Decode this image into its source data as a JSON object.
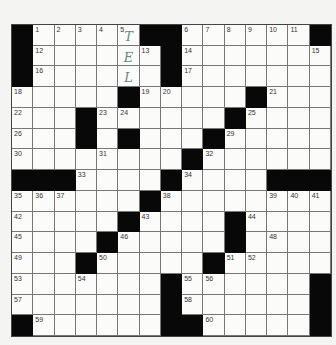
{
  "puzzle": {
    "rows": 15,
    "cols": 15,
    "colors": {
      "black": "#080808",
      "white": "#fbfbfa",
      "pencil": "#6a8a7c"
    },
    "grid": [
      "#.....##......#",
      "#......#.......",
      "#......#.......",
      ".....#.....#...",
      "...#......#....",
      "...#.#...#.....",
      "........#......",
      "###....#....###",
      "......#.....   ",
      ".....#....#....",
      "....#.....#....",
      "...#.....#.....",
      ".......#......#",
      ".......#......#",
      "#......##.....#"
    ],
    "numbers": [
      {
        "r": 0,
        "c": 1,
        "n": 1
      },
      {
        "r": 0,
        "c": 2,
        "n": 2
      },
      {
        "r": 0,
        "c": 3,
        "n": 3
      },
      {
        "r": 0,
        "c": 4,
        "n": 4
      },
      {
        "r": 0,
        "c": 5,
        "n": 5
      },
      {
        "r": 0,
        "c": 8,
        "n": 6
      },
      {
        "r": 0,
        "c": 9,
        "n": 7
      },
      {
        "r": 0,
        "c": 10,
        "n": 8
      },
      {
        "r": 0,
        "c": 11,
        "n": 9
      },
      {
        "r": 0,
        "c": 12,
        "n": 10
      },
      {
        "r": 0,
        "c": 13,
        "n": 11
      },
      {
        "r": 1,
        "c": 1,
        "n": 12
      },
      {
        "r": 1,
        "c": 6,
        "n": 13
      },
      {
        "r": 1,
        "c": 8,
        "n": 14
      },
      {
        "r": 1,
        "c": 14,
        "n": 15
      },
      {
        "r": 2,
        "c": 1,
        "n": 16
      },
      {
        "r": 2,
        "c": 8,
        "n": 17
      },
      {
        "r": 3,
        "c": 0,
        "n": 18
      },
      {
        "r": 3,
        "c": 6,
        "n": 19
      },
      {
        "r": 3,
        "c": 7,
        "n": 20
      },
      {
        "r": 3,
        "c": 12,
        "n": 21
      },
      {
        "r": 4,
        "c": 0,
        "n": 22
      },
      {
        "r": 4,
        "c": 4,
        "n": 23
      },
      {
        "r": 4,
        "c": 5,
        "n": 24
      },
      {
        "r": 4,
        "c": 11,
        "n": 25
      },
      {
        "r": 5,
        "c": 0,
        "n": 26
      },
      {
        "r": 5,
        "c": 3,
        "n": 27
      },
      {
        "r": 5,
        "c": 5,
        "n": 28
      },
      {
        "r": 5,
        "c": 10,
        "n": 29
      },
      {
        "r": 6,
        "c": 0,
        "n": 30
      },
      {
        "r": 6,
        "c": 4,
        "n": 31
      },
      {
        "r": 6,
        "c": 9,
        "n": 32
      },
      {
        "r": 7,
        "c": 3,
        "n": 33
      },
      {
        "r": 7,
        "c": 8,
        "n": 34
      },
      {
        "r": 8,
        "c": 0,
        "n": 35
      },
      {
        "r": 8,
        "c": 1,
        "n": 36
      },
      {
        "r": 8,
        "c": 2,
        "n": 37
      },
      {
        "r": 8,
        "c": 7,
        "n": 38
      },
      {
        "r": 8,
        "c": 12,
        "n": 39
      },
      {
        "r": 8,
        "c": 13,
        "n": 40
      },
      {
        "r": 8,
        "c": 14,
        "n": 41
      },
      {
        "r": 9,
        "c": 0,
        "n": 42
      },
      {
        "r": 9,
        "c": 6,
        "n": 43
      },
      {
        "r": 9,
        "c": 11,
        "n": 44
      },
      {
        "r": 10,
        "c": 0,
        "n": 45
      },
      {
        "r": 10,
        "c": 5,
        "n": 46
      },
      {
        "r": 10,
        "c": 10,
        "n": 47
      },
      {
        "r": 10,
        "c": 12,
        "n": 48
      },
      {
        "r": 11,
        "c": 0,
        "n": 49
      },
      {
        "r": 11,
        "c": 4,
        "n": 50
      },
      {
        "r": 11,
        "c": 10,
        "n": 51
      },
      {
        "r": 11,
        "c": 11,
        "n": 52
      },
      {
        "r": 12,
        "c": 0,
        "n": 53
      },
      {
        "r": 12,
        "c": 3,
        "n": 54
      },
      {
        "r": 12,
        "c": 8,
        "n": 55
      },
      {
        "r": 12,
        "c": 9,
        "n": 56
      },
      {
        "r": 13,
        "c": 0,
        "n": 57
      },
      {
        "r": 13,
        "c": 8,
        "n": 58
      },
      {
        "r": 14,
        "c": 1,
        "n": 59
      },
      {
        "r": 14,
        "c": 9,
        "n": 60
      }
    ],
    "entries": [
      {
        "r": 0,
        "c": 5,
        "letter": "T"
      },
      {
        "r": 1,
        "c": 5,
        "letter": "E"
      },
      {
        "r": 2,
        "c": 5,
        "letter": "L"
      }
    ]
  }
}
